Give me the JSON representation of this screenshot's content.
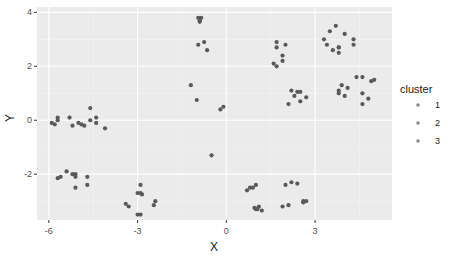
{
  "chart_data": {
    "type": "scatter",
    "title": "",
    "xlabel": "X",
    "ylabel": "Y",
    "xlim": [
      -6.4,
      5.6
    ],
    "ylim": [
      -3.7,
      4.2
    ],
    "xticks": [
      -6,
      -3,
      0,
      3
    ],
    "yticks": [
      -2,
      0,
      2,
      4
    ],
    "grid": true,
    "legend": {
      "title": "cluster",
      "position": "right",
      "entries": [
        "1",
        "2",
        "3"
      ]
    },
    "point_color": "#595959",
    "panel_background": "#ebebeb",
    "series": [
      {
        "name": "points",
        "x": [
          -5.9,
          -5.8,
          -5.7,
          -5.7,
          -5.3,
          -5.2,
          -5.0,
          -4.9,
          -4.8,
          -4.6,
          -4.6,
          -4.4,
          -4.4,
          -4.1,
          -5.7,
          -5.6,
          -5.4,
          -5.2,
          -5.1,
          -5.1,
          -4.7,
          -4.7,
          -5.1,
          -3.4,
          -3.3,
          -3.0,
          -2.9,
          -2.9,
          -2.85,
          -3.0,
          -2.9,
          -2.45,
          -2.4,
          -0.95,
          -0.9,
          -0.85,
          -0.9,
          -0.75,
          -0.95,
          -0.65,
          -1.2,
          -1.0,
          -0.2,
          -0.1,
          -0.5,
          1.7,
          1.7,
          2.0,
          1.9,
          1.9,
          1.6,
          1.7,
          2.2,
          2.4,
          2.5,
          2.1,
          2.5,
          2.3,
          2.7,
          3.5,
          3.3,
          3.7,
          4.0,
          4.3,
          3.8,
          3.4,
          3.6,
          3.8,
          3.8,
          4.3,
          3.8,
          3.8,
          3.9,
          4.1,
          4.4,
          4.6,
          4.6,
          4.9,
          5.0,
          4.6,
          4.0,
          4.8,
          0.7,
          0.8,
          0.9,
          1.0,
          1.0,
          1.1,
          0.95,
          1.05,
          1.2,
          2.0,
          2.2,
          2.4,
          2.6,
          2.6,
          2.7,
          2.1,
          1.9
        ],
        "y": [
          -0.1,
          -0.15,
          0.0,
          0.1,
          0.1,
          -0.2,
          -0.1,
          -0.15,
          -0.2,
          0.45,
          0.0,
          0.1,
          -0.1,
          -0.3,
          -2.15,
          -2.1,
          -1.9,
          -2.0,
          -2.1,
          -2.5,
          -2.1,
          -2.4,
          -2.0,
          -3.1,
          -3.2,
          -2.7,
          -2.4,
          -2.7,
          -2.75,
          -3.5,
          -3.5,
          -3.15,
          -3.0,
          3.8,
          3.7,
          3.8,
          3.65,
          2.9,
          2.8,
          2.6,
          1.3,
          0.75,
          0.4,
          0.5,
          -1.3,
          2.9,
          2.7,
          2.8,
          2.4,
          2.2,
          2.1,
          2.0,
          1.1,
          1.05,
          1.05,
          0.6,
          0.7,
          0.9,
          0.85,
          3.3,
          3.0,
          3.5,
          3.2,
          3.0,
          2.7,
          2.8,
          2.6,
          2.5,
          2.7,
          2.8,
          1.1,
          1.0,
          1.3,
          1.2,
          1.6,
          1.6,
          1.0,
          1.45,
          1.5,
          0.6,
          0.9,
          0.8,
          -2.6,
          -2.5,
          -2.5,
          -2.4,
          -3.3,
          -3.2,
          -3.25,
          -3.3,
          -3.35,
          -2.4,
          -2.3,
          -2.35,
          -3.0,
          -3.05,
          -3.0,
          -3.15,
          -3.2
        ]
      }
    ]
  }
}
